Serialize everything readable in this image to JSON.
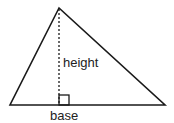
{
  "diagram": {
    "labels": {
      "height": "height",
      "base": "base"
    },
    "shapes": {
      "triangle": {
        "apex": [
          59,
          8
        ],
        "left": [
          10,
          105
        ],
        "right": [
          165,
          105
        ]
      },
      "height_line": {
        "from": [
          59,
          8
        ],
        "to": [
          59,
          105
        ],
        "style": "dotted"
      },
      "right_angle_marker": {
        "x": 59,
        "y": 95,
        "size": 10
      }
    },
    "colors": {
      "stroke": "#1a1a1a",
      "background": "#ffffff"
    }
  }
}
